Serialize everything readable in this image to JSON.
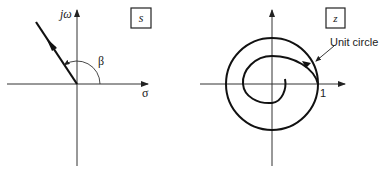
{
  "left_panel": {
    "plane_label": "s",
    "vertical_axis_label": "jω",
    "horizontal_axis_label": "σ",
    "angle_label": "β"
  },
  "right_panel": {
    "plane_label": "z",
    "circle_label": "Unit circle",
    "real_tick_label": "1"
  },
  "colors": {
    "line": "#111111",
    "axis": "#333333",
    "background": "#ffffff"
  }
}
